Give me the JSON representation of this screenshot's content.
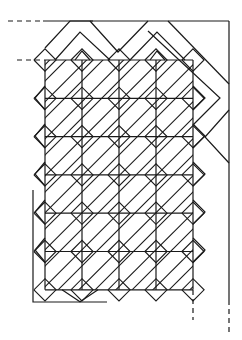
{
  "diagram": {
    "title": "",
    "type": "interlaced-lattice-pattern",
    "colors": {
      "background": "#ffffff",
      "stroke": "#1a1a1a"
    },
    "grid": {
      "left": 45,
      "top": 60,
      "cell_w": 37,
      "cell_h": 38.3,
      "cols": 4,
      "rows": 6
    },
    "outer_frame": {
      "top_y": 21,
      "top_x1": 43,
      "right_x": 229,
      "bottom_solid_y": 300,
      "bottom_dashed_y": 335
    },
    "dashed_leaders": [
      {
        "x1": 8,
        "y1": 21,
        "x2": 43,
        "y2": 21
      },
      {
        "x1": 17,
        "y1": 60,
        "x2": 45,
        "y2": 60
      },
      {
        "x1": 193,
        "y1": 290,
        "x2": 193,
        "y2": 320
      },
      {
        "x1": 229,
        "y1": 300,
        "x2": 229,
        "y2": 335
      }
    ],
    "bottom_bracket": {
      "x": 33,
      "y_top": 190,
      "y_bottom": 302,
      "x_end": 107
    }
  }
}
